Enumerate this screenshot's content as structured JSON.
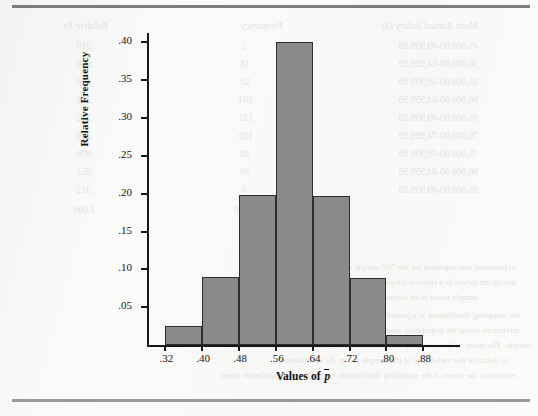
{
  "page": {
    "background_color": "#fbfbfa",
    "rule_top_color": "#7c7c7c",
    "rule_bottom_color": "#9a9a9a"
  },
  "chart_data": {
    "type": "bar",
    "title": "",
    "subtitle": "",
    "xlabel": "Values of p̄",
    "ylabel": "Relative Frequency",
    "grid": false,
    "legend": false,
    "bar_fill_color": "#8a8a8a",
    "bar_border_color": "#2d2d2d",
    "xlim": [
      0.28,
      0.96
    ],
    "ylim": [
      0.0,
      0.4125
    ],
    "x_tick_labels": [
      ".32",
      ".40",
      ".48",
      ".56",
      ".64",
      ".72",
      ".80",
      ".88"
    ],
    "x_tick_values": [
      0.32,
      0.4,
      0.48,
      0.56,
      0.64,
      0.72,
      0.8,
      0.88
    ],
    "y_tick_labels": [
      ".05",
      ".10",
      ".15",
      ".20",
      ".25",
      ".30",
      ".35",
      ".40"
    ],
    "y_tick_values": [
      0.05,
      0.1,
      0.15,
      0.2,
      0.25,
      0.3,
      0.35,
      0.4
    ],
    "bin_edges": [
      0.32,
      0.4,
      0.48,
      0.56,
      0.64,
      0.72,
      0.8,
      0.88
    ],
    "categories": [
      ".32-.40",
      ".40-.48",
      ".48-.56",
      ".56-.64",
      ".64-.72",
      ".72-.80",
      ".80-.88"
    ],
    "values": [
      0.025,
      0.09,
      0.198,
      0.4,
      0.197,
      0.088,
      0.013
    ]
  },
  "ghost_text": {
    "note": "faint reversed show-through text from the opposite side of the printed page",
    "column_headers": [
      "Mean Annual Salary ($)",
      "Frequency",
      "Relative Fr"
    ],
    "rows": [
      "45,000.00-49,999.99",
      "50,000.00-54,999.99",
      "55,000.00-59,999.99",
      "60,000.00-64,999.99",
      "65,000.00-69,999.99",
      "70,000.00-74,999.99",
      "75,000.00-79,999.99",
      "80,000.00-84,999.99",
      "85,000.00-89,999.99"
    ],
    "freq_values": [
      "5",
      "18",
      "52",
      "104",
      "131",
      "110",
      "48",
      "26",
      "6",
      "500"
    ],
    "relfreq_values": [
      ".010",
      ".036",
      ".104",
      ".208",
      ".262",
      ".220",
      ".096",
      ".052",
      ".012",
      "1.000"
    ],
    "total_label": "Total  500",
    "paragraph_lines": [
      "experiment was repeated for the 500 simple random samples and the",
      "histogram below is a relative frequency histogram for the sample means. Each",
      "sample mean is an estimate of the population mean.",
      "the sampling distribution is a probability distribution and can be used to support",
      "inferences about the population mean based on selecting a simple random",
      "sample. The mean of the sampling distribution and its standard deviation are used",
      "to describe the variability of the sample mean. As an unbiased",
      "estimator, the mean of the sampling distribution is equal to the population mean."
    ]
  }
}
